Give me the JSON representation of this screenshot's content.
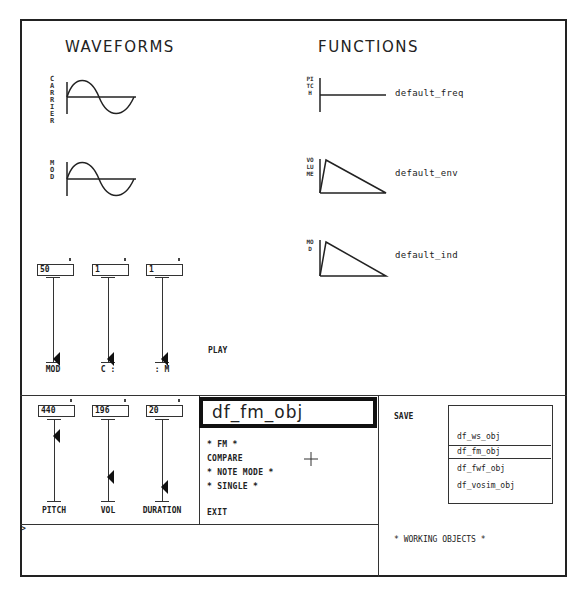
{
  "waveforms": {
    "heading": "WAVEFORMS",
    "carrier_label": "CARRIER",
    "mod_label": "MOD"
  },
  "functions": {
    "heading": "FUNCTIONS",
    "items": [
      {
        "axis_label": "PITCH",
        "name": "default_freq",
        "shape": "flat"
      },
      {
        "axis_label": "VOLUME",
        "name": "default_env",
        "shape": "triangle"
      },
      {
        "axis_label": "MOD",
        "name": "default_ind",
        "shape": "triangle"
      }
    ]
  },
  "upper_sliders": [
    {
      "value": "50",
      "label": "MOD"
    },
    {
      "value": "1",
      "label": "C :"
    },
    {
      "value": "1",
      "label": ": M"
    }
  ],
  "play_label": "PLAY",
  "lower_sliders": [
    {
      "value": "440",
      "label": "PITCH"
    },
    {
      "value": "196",
      "label": "VOL"
    },
    {
      "value": "20",
      "label": "DURATION"
    }
  ],
  "object_panel": {
    "title": "df_fm_obj",
    "menu": [
      "* FM *",
      "COMPARE",
      "* NOTE MODE *",
      "* SINGLE *",
      "EXIT"
    ]
  },
  "save_label": "SAVE",
  "working_objects": {
    "items": [
      "df_ws_obj",
      "df_fm_obj",
      "df_fwf_obj",
      "df_vosim_obj"
    ],
    "selected": "df_fm_obj",
    "caption": "* WORKING OBJECTS *"
  },
  "command_line": {
    "prompt": ">",
    "value": ""
  },
  "cursor_icon": "crosshair"
}
